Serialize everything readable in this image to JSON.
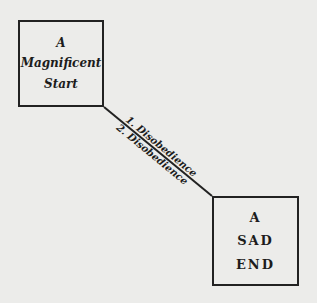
{
  "start_box": {
    "lines": [
      "A",
      "Magnificent",
      "Start"
    ]
  },
  "end_box": {
    "lines": [
      "A",
      "SAD",
      "END"
    ]
  },
  "connector": {
    "label_above": "1. Disobedience",
    "label_below": "2. Disobedience"
  }
}
